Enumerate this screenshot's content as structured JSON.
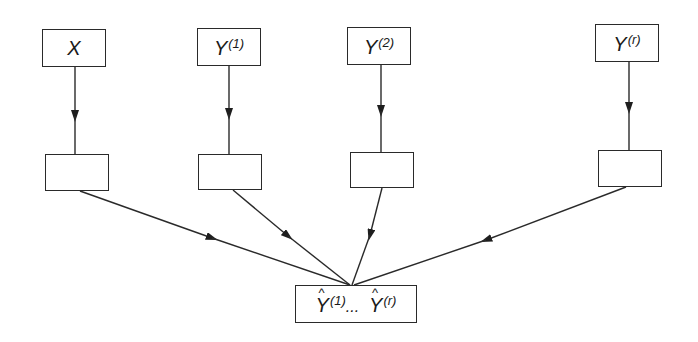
{
  "diagram": {
    "colors": {
      "stroke": "#2a2a2a",
      "background": "#ffffff"
    },
    "inputs": [
      {
        "id": "x",
        "base": "X",
        "sup": ""
      },
      {
        "id": "y1",
        "base": "Y",
        "sup": "(1)"
      },
      {
        "id": "y2",
        "base": "Y",
        "sup": "(2)"
      },
      {
        "id": "yr",
        "base": "Y",
        "sup": "(r)"
      }
    ],
    "intermediate_boxes": [
      {
        "id": "h1",
        "label": ""
      },
      {
        "id": "h2",
        "label": ""
      },
      {
        "id": "h3",
        "label": ""
      },
      {
        "id": "h4",
        "label": ""
      }
    ],
    "output": {
      "first_base": "Y",
      "first_sup": "(1)",
      "ellipsis": "...",
      "last_base": "Y",
      "last_sup": "(r)"
    },
    "edges": [
      {
        "from": "x",
        "to": "h1"
      },
      {
        "from": "y1",
        "to": "h2"
      },
      {
        "from": "y2",
        "to": "h3"
      },
      {
        "from": "yr",
        "to": "h4"
      },
      {
        "from": "h1",
        "to": "output"
      },
      {
        "from": "h2",
        "to": "output"
      },
      {
        "from": "h3",
        "to": "output"
      },
      {
        "from": "h4",
        "to": "output"
      }
    ]
  }
}
